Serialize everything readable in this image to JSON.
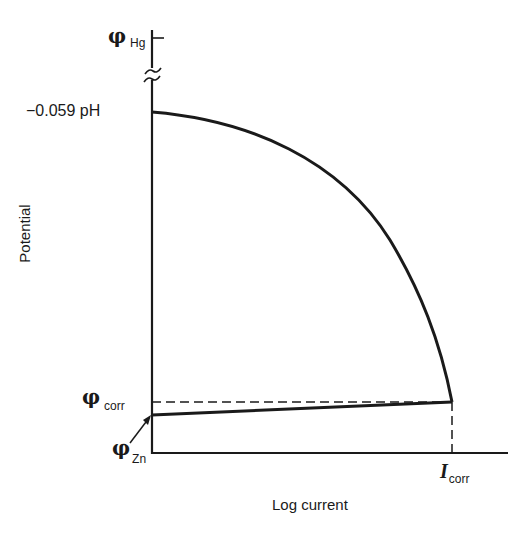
{
  "diagram": {
    "type": "polarization-curve",
    "y_axis": {
      "title": "Potential",
      "labels": {
        "phi_hg": {
          "symbol": "φ",
          "subscript": "Hg"
        },
        "ph_level": "−0.059 pH",
        "phi_corr": {
          "symbol": "φ",
          "subscript": "corr"
        },
        "phi_zn": {
          "symbol": "φ",
          "subscript": "Zn"
        }
      }
    },
    "x_axis": {
      "title": "Log current",
      "labels": {
        "i_corr": {
          "symbol": "I",
          "subscript": "corr"
        }
      }
    },
    "curves": [
      {
        "name": "cathodic-hydrogen-curve",
        "description": "Curve from −0.059 pH falling to intersection at I_corr"
      },
      {
        "name": "anodic-zinc-line",
        "description": "Line rising from φ_Zn to intersection at I_corr"
      }
    ],
    "reference_lines": [
      {
        "name": "phi-corr-dashed",
        "style": "dashed",
        "orientation": "horizontal"
      },
      {
        "name": "i-corr-dashed",
        "style": "dashed",
        "orientation": "vertical"
      }
    ],
    "colors": {
      "ink": "#1a1a1a",
      "background": "#ffffff"
    }
  }
}
